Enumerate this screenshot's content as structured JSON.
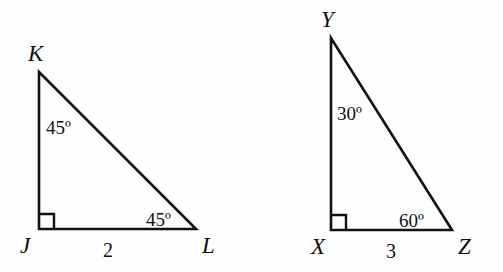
{
  "figure": {
    "background_color": "#fefefe",
    "stroke_color": "#111111",
    "triangles": [
      {
        "name": "triangle-jkl",
        "vertices": [
          {
            "label": "J",
            "x": 39,
            "y": 229,
            "label_x": 20,
            "label_y": 234
          },
          {
            "label": "K",
            "x": 39,
            "y": 72,
            "label_x": 28,
            "label_y": 42
          },
          {
            "label": "L",
            "x": 196,
            "y": 229,
            "label_x": 202,
            "label_y": 234
          }
        ],
        "right_angle_at": "J",
        "angles": [
          {
            "label": "45º",
            "at_vertex": "K",
            "x": 46,
            "y": 118
          },
          {
            "label": "45º",
            "at_vertex": "L",
            "x": 146,
            "y": 210
          }
        ],
        "sides": [
          {
            "label": "2",
            "from": "J",
            "to": "L",
            "x": 103,
            "y": 240
          }
        ]
      },
      {
        "name": "triangle-xyz",
        "vertices": [
          {
            "label": "X",
            "x": 331,
            "y": 230,
            "label_x": 311,
            "label_y": 235
          },
          {
            "label": "Y",
            "x": 331,
            "y": 38,
            "label_x": 321,
            "label_y": 8
          },
          {
            "label": "Z",
            "x": 452,
            "y": 230,
            "label_x": 458,
            "label_y": 235
          }
        ],
        "right_angle_at": "X",
        "angles": [
          {
            "label": "30º",
            "at_vertex": "Y",
            "x": 337,
            "y": 104
          },
          {
            "label": "60º",
            "at_vertex": "Z",
            "x": 399,
            "y": 211
          }
        ],
        "sides": [
          {
            "label": "3",
            "from": "X",
            "to": "Z",
            "x": 386,
            "y": 241
          }
        ]
      }
    ]
  }
}
